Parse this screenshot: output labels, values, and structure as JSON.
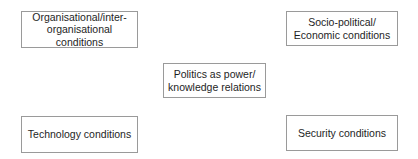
{
  "diagram": {
    "type": "concept-map",
    "center": {
      "id": "politics",
      "label": "Politics as power/\nknowledge relations"
    },
    "nodes": [
      {
        "id": "org",
        "position": "top-left",
        "label": "Organisational/inter-\norganisational conditions"
      },
      {
        "id": "socio",
        "position": "top-right",
        "label": "Socio-political/\nEconomic conditions"
      },
      {
        "id": "tech",
        "position": "bottom-left",
        "label": "Technology conditions"
      },
      {
        "id": "security",
        "position": "bottom-right",
        "label": "Security conditions"
      }
    ],
    "colors": {
      "border": "#9a9a9a",
      "text": "#1e1e1e",
      "background": "#ffffff"
    }
  }
}
